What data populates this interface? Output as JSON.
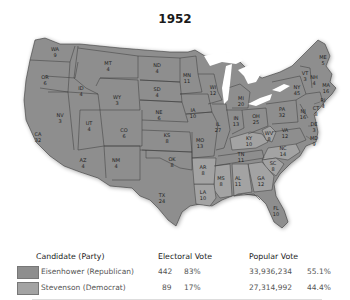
{
  "title": "1952",
  "colors": {
    "republican": "#8e8e8e",
    "democrat": "#a3a3a3",
    "border": "#3a3a3a",
    "water": "#ffffff"
  },
  "states": [
    {
      "abbr": "WA",
      "ev": "9",
      "winner": "R",
      "x": 55,
      "y": 52
    },
    {
      "abbr": "OR",
      "ev": "6",
      "winner": "R",
      "x": 45,
      "y": 80
    },
    {
      "abbr": "CA",
      "ev": "32",
      "winner": "R",
      "x": 38,
      "y": 137
    },
    {
      "abbr": "NV",
      "ev": "3",
      "winner": "R",
      "x": 60,
      "y": 118
    },
    {
      "abbr": "ID",
      "ev": "4",
      "winner": "R",
      "x": 81,
      "y": 91
    },
    {
      "abbr": "MT",
      "ev": "4",
      "winner": "R",
      "x": 108,
      "y": 66
    },
    {
      "abbr": "WY",
      "ev": "3",
      "winner": "R",
      "x": 117,
      "y": 100
    },
    {
      "abbr": "UT",
      "ev": "4",
      "winner": "R",
      "x": 89,
      "y": 126
    },
    {
      "abbr": "CO",
      "ev": "6",
      "winner": "R",
      "x": 124,
      "y": 133
    },
    {
      "abbr": "AZ",
      "ev": "4",
      "winner": "R",
      "x": 83,
      "y": 163
    },
    {
      "abbr": "NM",
      "ev": "4",
      "winner": "R",
      "x": 116,
      "y": 163
    },
    {
      "abbr": "ND",
      "ev": "4",
      "winner": "R",
      "x": 157,
      "y": 68
    },
    {
      "abbr": "SD",
      "ev": "4",
      "winner": "R",
      "x": 157,
      "y": 92
    },
    {
      "abbr": "NE",
      "ev": "6",
      "winner": "R",
      "x": 159,
      "y": 115
    },
    {
      "abbr": "KS",
      "ev": "8",
      "winner": "R",
      "x": 167,
      "y": 138
    },
    {
      "abbr": "OK",
      "ev": "8",
      "winner": "R",
      "x": 172,
      "y": 162
    },
    {
      "abbr": "TX",
      "ev": "24",
      "winner": "R",
      "x": 162,
      "y": 198
    },
    {
      "abbr": "MN",
      "ev": "11",
      "winner": "R",
      "x": 187,
      "y": 78
    },
    {
      "abbr": "IA",
      "ev": "10",
      "winner": "R",
      "x": 193,
      "y": 113
    },
    {
      "abbr": "MO",
      "ev": "13",
      "winner": "R",
      "x": 200,
      "y": 143
    },
    {
      "abbr": "AR",
      "ev": "8",
      "winner": "D",
      "x": 203,
      "y": 170
    },
    {
      "abbr": "LA",
      "ev": "10",
      "winner": "D",
      "x": 203,
      "y": 195
    },
    {
      "abbr": "WI",
      "ev": "12",
      "winner": "R",
      "x": 213,
      "y": 90
    },
    {
      "abbr": "IL",
      "ev": "27",
      "winner": "R",
      "x": 218,
      "y": 127
    },
    {
      "abbr": "MS",
      "ev": "8",
      "winner": "D",
      "x": 221,
      "y": 181
    },
    {
      "abbr": "MI",
      "ev": "20",
      "winner": "R",
      "x": 241,
      "y": 101
    },
    {
      "abbr": "IN",
      "ev": "13",
      "winner": "R",
      "x": 236,
      "y": 121
    },
    {
      "abbr": "KY",
      "ev": "10",
      "winner": "D",
      "x": 249,
      "y": 141
    },
    {
      "abbr": "TN",
      "ev": "11",
      "winner": "R",
      "x": 241,
      "y": 157
    },
    {
      "abbr": "AL",
      "ev": "11",
      "winner": "D",
      "x": 238,
      "y": 181
    },
    {
      "abbr": "OH",
      "ev": "25",
      "winner": "R",
      "x": 256,
      "y": 119
    },
    {
      "abbr": "WV",
      "ev": "8",
      "winner": "D",
      "x": 269,
      "y": 136
    },
    {
      "abbr": "VA",
      "ev": "12",
      "winner": "R",
      "x": 285,
      "y": 133
    },
    {
      "abbr": "NC",
      "ev": "14",
      "winner": "D",
      "x": 283,
      "y": 151
    },
    {
      "abbr": "SC",
      "ev": "8",
      "winner": "D",
      "x": 273,
      "y": 166
    },
    {
      "abbr": "GA",
      "ev": "12",
      "winner": "D",
      "x": 261,
      "y": 181
    },
    {
      "abbr": "FL",
      "ev": "10",
      "winner": "R",
      "x": 276,
      "y": 211
    },
    {
      "abbr": "PA",
      "ev": "32",
      "winner": "R",
      "x": 282,
      "y": 112
    },
    {
      "abbr": "NY",
      "ev": "45",
      "winner": "R",
      "x": 297,
      "y": 90
    },
    {
      "abbr": "NJ",
      "ev": "16",
      "winner": "R",
      "x": 303,
      "y": 114
    },
    {
      "abbr": "DE",
      "ev": "3",
      "winner": "R",
      "x": 314,
      "y": 127
    },
    {
      "abbr": "MD",
      "ev": "9",
      "winner": "R",
      "x": 314,
      "y": 141
    },
    {
      "abbr": "CT",
      "ev": "8",
      "winner": "R",
      "x": 316,
      "y": 111
    },
    {
      "abbr": "RI",
      "ev": "4",
      "winner": "R",
      "x": 323,
      "y": 103
    },
    {
      "abbr": "MA",
      "ev": "16",
      "winner": "R",
      "x": 326,
      "y": 88
    },
    {
      "abbr": "VT",
      "ev": "3",
      "winner": "R",
      "x": 305,
      "y": 76
    },
    {
      "abbr": "NH",
      "ev": "4",
      "winner": "R",
      "x": 314,
      "y": 80
    },
    {
      "abbr": "ME",
      "ev": "5",
      "winner": "R",
      "x": 323,
      "y": 60
    }
  ],
  "legend": {
    "headers": {
      "candidate": "Candidate (Party)",
      "electoral": "Electoral Vote",
      "popular": "Popular Vote"
    },
    "rows": [
      {
        "candidate": "Eisenhower (Republican)",
        "ev": "442",
        "ev_pct": "83%",
        "popular": "33,936,234",
        "pop_pct": "55.1%",
        "color": "#8e8e8e"
      },
      {
        "candidate": "Stevenson (Democrat)",
        "ev": "89",
        "ev_pct": "17%",
        "popular": "27,314,992",
        "pop_pct": "44.4%",
        "color": "#a3a3a3"
      }
    ]
  }
}
